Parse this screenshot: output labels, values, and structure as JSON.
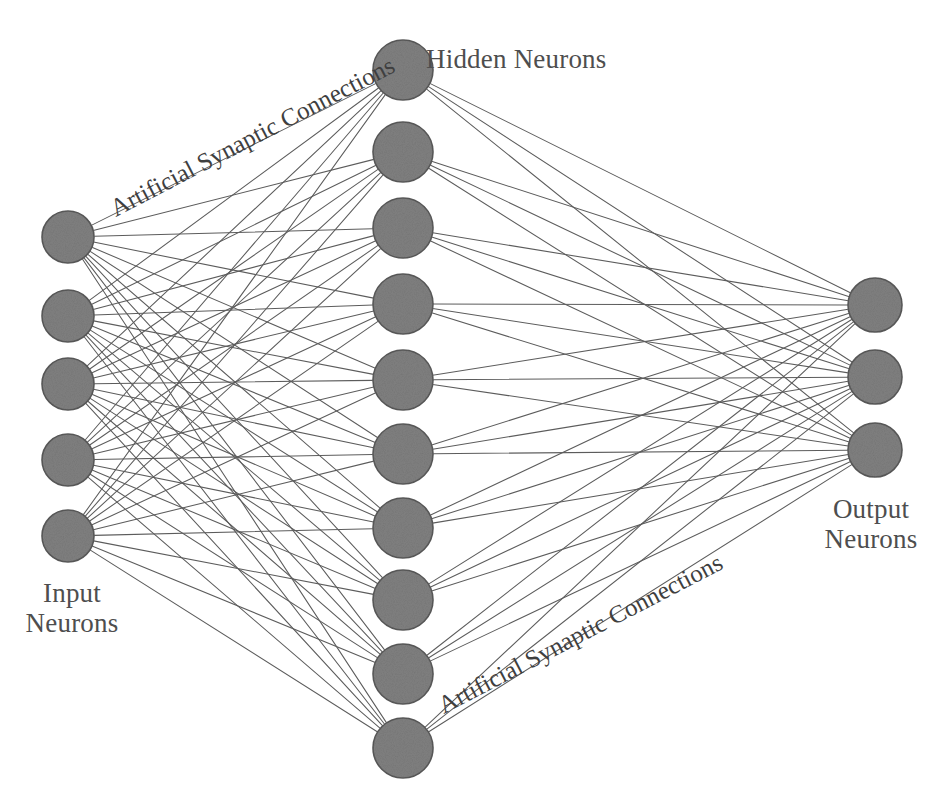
{
  "figure": {
    "type": "neural-network-diagram",
    "background_color": "#ffffff",
    "neuron_fill_color": "#808080",
    "neuron_stroke_color": "#5a5a5a",
    "connection_color": "#5c5c5c",
    "text_color": "#4e4e4e"
  },
  "labels": {
    "input": "Input\nNeurons",
    "input_line1": "Input",
    "input_line2": "Neurons",
    "hidden": "Hidden Neurons",
    "output_line1": "Output",
    "output_line2": "Neurons",
    "synapse_top": "Artificial Synaptic Connections",
    "synapse_bottom": "Artificial Synaptic Connections",
    "bottom_caption": ""
  },
  "chart_data": {
    "type": "diagram",
    "layers": [
      {
        "name": "input",
        "label": "Input Neurons",
        "count": 5,
        "radius": 26,
        "cx": 68,
        "cy": [
          237,
          316,
          384,
          460,
          536
        ]
      },
      {
        "name": "hidden",
        "label": "Hidden Neurons",
        "count": 10,
        "radius": 30,
        "cx": 403,
        "cy": [
          70,
          152,
          228,
          304,
          380,
          454,
          528,
          600,
          674,
          748
        ]
      },
      {
        "name": "output",
        "label": "Output Neurons",
        "count": 3,
        "radius": 27,
        "cx": 875,
        "cy": [
          305,
          377,
          450
        ]
      }
    ],
    "connections": [
      {
        "from": "input",
        "to": "hidden",
        "pattern": "fully-connected",
        "edges": 50
      },
      {
        "from": "hidden",
        "to": "output",
        "pattern": "fully-connected",
        "edges": 30
      }
    ]
  }
}
